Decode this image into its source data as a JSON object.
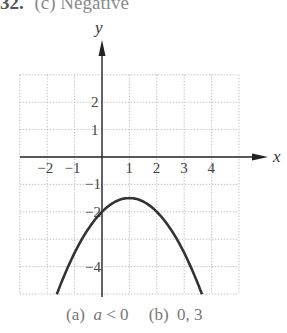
{
  "header": {
    "number": "32.",
    "text": "(c)  Negative"
  },
  "caption": {
    "part_a_label": "(a)",
    "part_a_var": "a",
    "part_a_rest": " < 0",
    "part_b_label": "(b)",
    "part_b_value": "0, 3"
  },
  "chart_data": {
    "type": "line",
    "title": "",
    "xlabel": "x",
    "ylabel": "y",
    "xlim": [
      -3,
      5
    ],
    "ylim": [
      -5,
      3
    ],
    "grid": true,
    "x_ticks": [
      "-2",
      "-1",
      "1",
      "2",
      "3",
      "4"
    ],
    "y_ticks": [
      "2",
      "1",
      "-1",
      "-2",
      "-4"
    ],
    "series": [
      {
        "name": "parabola y = -0.5(x-1)^2 - 1.5",
        "vertex": [
          1,
          -1.5
        ],
        "y_intercept": -2,
        "x": [
          -1.65,
          -1,
          0,
          1,
          2,
          3,
          3.65
        ],
        "y": [
          -5,
          -3.5,
          -2,
          -1.5,
          -2,
          -3.5,
          -5
        ]
      }
    ],
    "color": "#333333"
  }
}
